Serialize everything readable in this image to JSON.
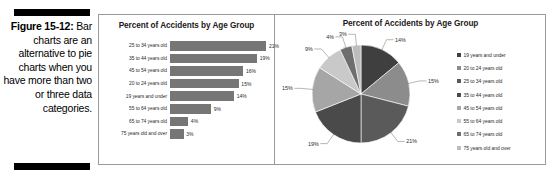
{
  "caption": {
    "figure_label": "Figure 15-12:",
    "body": "Bar charts are an alternative to pie charts when you have more than two or three data categories."
  },
  "bar_chart": {
    "title": "Percent of Accidents by Age Group"
  },
  "pie_chart": {
    "title": "Percent of Accidents by Age Group"
  },
  "chart_data": [
    {
      "type": "bar",
      "title": "Percent of Accidents by Age Group",
      "orientation": "horizontal",
      "xlabel": "",
      "ylabel": "",
      "xlim": [
        0,
        22
      ],
      "grid": false,
      "legend": "none",
      "bar_color": "#767676",
      "categories": [
        "25 to 34 years old",
        "35 to 44 years old",
        "45 to 54 years old",
        "20 to 24 years old",
        "19 years and under",
        "55 to 64 years old",
        "65 to 74 years old",
        "75 years old and over"
      ],
      "values": [
        21,
        19,
        16,
        15,
        14,
        9,
        4,
        3
      ],
      "value_labels": [
        "21%",
        "19%",
        "16%",
        "15%",
        "14%",
        "9%",
        "4%",
        "3%"
      ]
    },
    {
      "type": "pie",
      "title": "Percent of Accidents by Age Group",
      "legend": "right",
      "labels": [
        "19 years and under",
        "20 to 24 years old",
        "25 to 34 years old",
        "35 to 44 years old",
        "45 to 54 years old",
        "55 to 64 years old",
        "65 to 74 years old",
        "75 years old and over"
      ],
      "values": [
        14,
        15,
        21,
        19,
        15,
        9,
        4,
        3
      ],
      "value_labels": [
        "14%",
        "15%",
        "21%",
        "19%",
        "15%",
        "9%",
        "4%",
        "3%"
      ],
      "colors": [
        "#3f3f3f",
        "#8c8c8c",
        "#5a5a5a",
        "#4a4a4a",
        "#a6a6a6",
        "#c9c9c9",
        "#6e6e6e",
        "#bdbdbd"
      ]
    }
  ]
}
